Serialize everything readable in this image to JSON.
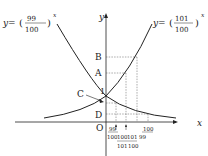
{
  "diagram": {
    "curve_left": {
      "label_prefix": "y=",
      "base_num": "99",
      "base_den": "100",
      "exponent": "x"
    },
    "curve_right": {
      "label_prefix": "y=",
      "base_num": "101",
      "base_den": "100",
      "exponent": "x"
    },
    "y_axis_label": "y",
    "x_axis_label": "x",
    "origin_label": "O",
    "one_label": "1",
    "points": {
      "B": "B",
      "A": "A",
      "C": "C",
      "D": "D"
    },
    "x_ticks": [
      {
        "num": "99",
        "den": "100"
      },
      {
        "num": "100",
        "den": "101"
      },
      {
        "num": "101",
        "den": "100"
      },
      {
        "num": "100",
        "den": "99"
      }
    ]
  }
}
